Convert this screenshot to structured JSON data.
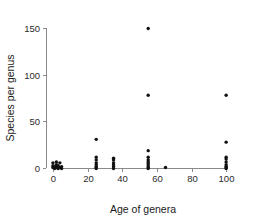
{
  "chart_data": {
    "type": "scatter",
    "title": "",
    "xlabel": "Age of genera",
    "ylabel": "Species per genus",
    "xlim": [
      -4,
      108
    ],
    "ylim": [
      -8,
      158
    ],
    "xticks": [
      0,
      20,
      40,
      60,
      80,
      100
    ],
    "yticks": [
      0,
      50,
      100,
      150
    ],
    "xtick_labels": [
      "0",
      "20",
      "40",
      "60",
      "80",
      "100"
    ],
    "ytick_labels": [
      "0",
      "50",
      "100",
      "150"
    ],
    "grid": false,
    "legend": null,
    "marker": {
      "shape": "circle",
      "color": "#111111",
      "size_px": 3.4
    },
    "series": [
      {
        "name": "genera",
        "points": [
          [
            0,
            1
          ],
          [
            0,
            3
          ],
          [
            0,
            6
          ],
          [
            1,
            0
          ],
          [
            1,
            2
          ],
          [
            2,
            1
          ],
          [
            2,
            4
          ],
          [
            2,
            7
          ],
          [
            3,
            0
          ],
          [
            3,
            3
          ],
          [
            4,
            1
          ],
          [
            4,
            6
          ],
          [
            5,
            0
          ],
          [
            5,
            2
          ],
          [
            25,
            31
          ],
          [
            25,
            12
          ],
          [
            25,
            9
          ],
          [
            25,
            6
          ],
          [
            25,
            4
          ],
          [
            25,
            2
          ],
          [
            25,
            0
          ],
          [
            25,
            1
          ],
          [
            35,
            11
          ],
          [
            35,
            9
          ],
          [
            35,
            6
          ],
          [
            35,
            4
          ],
          [
            35,
            2
          ],
          [
            35,
            0
          ],
          [
            55,
            149
          ],
          [
            55,
            78
          ],
          [
            55,
            19
          ],
          [
            55,
            12
          ],
          [
            55,
            9
          ],
          [
            55,
            7
          ],
          [
            55,
            5
          ],
          [
            55,
            3
          ],
          [
            55,
            1
          ],
          [
            55,
            0
          ],
          [
            65,
            1
          ],
          [
            100,
            78
          ],
          [
            100,
            28
          ],
          [
            100,
            12
          ],
          [
            100,
            10
          ],
          [
            100,
            7
          ],
          [
            100,
            4
          ],
          [
            100,
            2
          ],
          [
            100,
            1
          ],
          [
            100,
            0
          ]
        ]
      }
    ]
  },
  "axes": {
    "x_label": "Age of genera",
    "y_label": "Species per genus"
  }
}
